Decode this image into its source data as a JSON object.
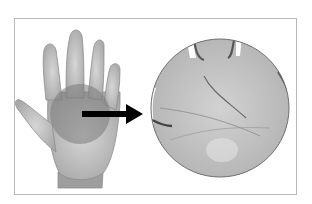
{
  "figure": {
    "elements": {
      "hand": "left open hand, palm facing viewer, grayscale",
      "highlight": "darker shaded circle over center of palm",
      "arrow": "black arrow pointing right",
      "magnified_view": "large circle showing close-up of palm lines"
    },
    "colors": {
      "frame": "#b8b8b8",
      "hand": "#bdbdbd",
      "highlight": "#8a8a8a",
      "arrow": "#000000",
      "magnified": "#c4c4c4"
    }
  }
}
